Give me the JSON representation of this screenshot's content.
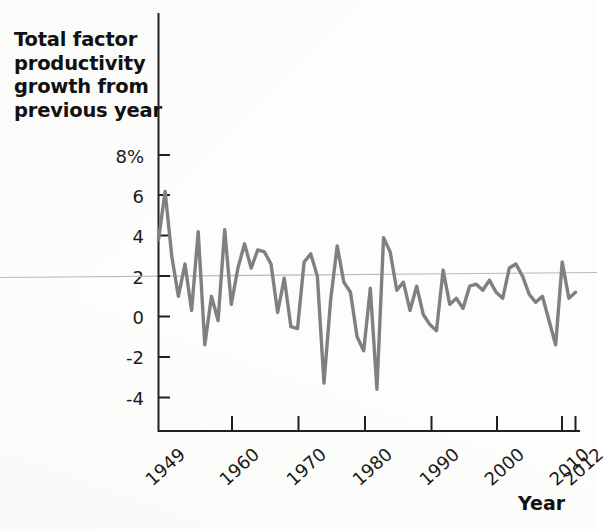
{
  "chart_data": {
    "type": "line",
    "title": "Total factor productivity growth from previous year",
    "xlabel": "Year",
    "ylabel": "Total factor productivity growth from previous year",
    "ylim": [
      -5.2,
      8.8
    ],
    "xlim": [
      1949,
      2012
    ],
    "grid": "single horizontal reference line near 2%",
    "legend": "none",
    "line_color": "#808080",
    "axis_color": "#1a1a1a",
    "y_ticks": [
      "8%",
      "6",
      "4",
      "2",
      "0",
      "-2",
      "-4"
    ],
    "y_tick_values": [
      8,
      6,
      4,
      2,
      0,
      -2,
      -4
    ],
    "x_ticks": [
      "1949",
      "1960",
      "1970",
      "1980",
      "1990",
      "2000",
      "2010",
      "2012"
    ],
    "x_tick_values": [
      1949,
      1960,
      1970,
      1980,
      1990,
      2000,
      2010,
      2012
    ],
    "reference_line_value": 2.0,
    "x": [
      1949,
      1950,
      1951,
      1952,
      1953,
      1954,
      1955,
      1956,
      1957,
      1958,
      1959,
      1960,
      1961,
      1962,
      1963,
      1964,
      1965,
      1966,
      1967,
      1968,
      1969,
      1970,
      1971,
      1972,
      1973,
      1974,
      1975,
      1976,
      1977,
      1978,
      1979,
      1980,
      1981,
      1982,
      1983,
      1984,
      1985,
      1986,
      1987,
      1988,
      1989,
      1990,
      1991,
      1992,
      1993,
      1994,
      1995,
      1996,
      1997,
      1998,
      1999,
      2000,
      2001,
      2002,
      2003,
      2004,
      2005,
      2006,
      2007,
      2008,
      2009,
      2010,
      2011,
      2012
    ],
    "values": [
      3.8,
      6.2,
      3.0,
      1.0,
      2.6,
      0.3,
      4.2,
      -1.4,
      1.0,
      -0.2,
      4.3,
      0.6,
      2.4,
      3.6,
      2.4,
      3.3,
      3.2,
      2.6,
      0.2,
      1.9,
      -0.5,
      -0.6,
      2.7,
      3.1,
      2.0,
      -3.3,
      0.8,
      3.5,
      1.7,
      1.2,
      -1.0,
      -1.7,
      1.4,
      -3.6,
      3.9,
      3.2,
      1.3,
      1.7,
      0.3,
      1.5,
      0.1,
      -0.4,
      -0.7,
      2.3,
      0.6,
      0.9,
      0.4,
      1.5,
      1.6,
      1.3,
      1.8,
      1.2,
      0.9,
      2.4,
      2.6,
      2.0,
      1.1,
      0.7,
      1.0,
      -0.2,
      -1.4,
      2.7,
      0.9,
      1.2
    ]
  },
  "title": {
    "line1": "Total factor",
    "line2": "productivity",
    "line3": "growth from",
    "line4": "previous year",
    "full": "Total factor productivity growth from previous year"
  },
  "xaxis": {
    "label": "Year"
  }
}
